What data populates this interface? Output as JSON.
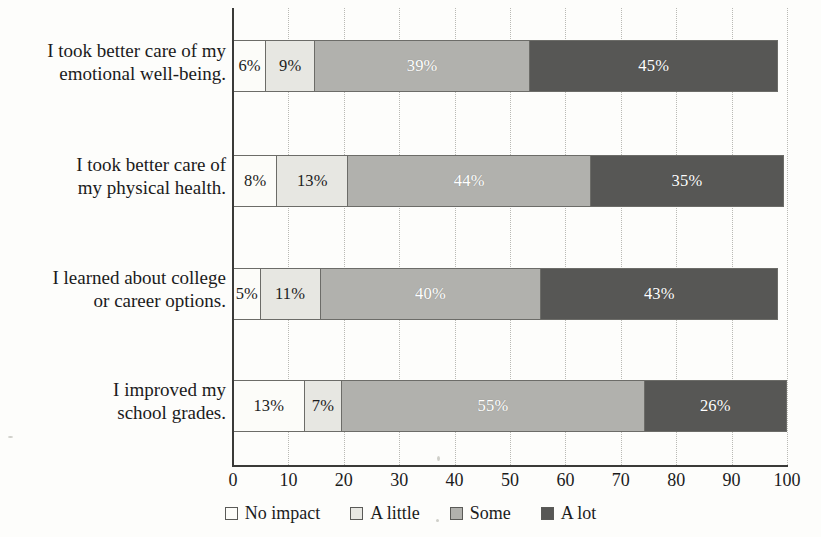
{
  "chart_data": {
    "type": "bar",
    "orientation": "horizontal",
    "stacked": true,
    "title": "",
    "xlabel": "",
    "ylabel": "",
    "xlim": [
      0,
      100
    ],
    "xticks": [
      "0",
      "10",
      "20",
      "30",
      "40",
      "50",
      "60",
      "70",
      "80",
      "90",
      "100"
    ],
    "grid": "vertical-dotted",
    "legend_position": "bottom-center",
    "categories": [
      "I took better care of my emotional well-being.",
      "I took better care of my physical health.",
      "I learned about college or career options.",
      "I improved my school grades."
    ],
    "series": [
      {
        "name": "No impact",
        "color": "#fcfcf9",
        "values": [
          6,
          8,
          5,
          13
        ]
      },
      {
        "name": "A little",
        "color": "#e7e7e2",
        "values": [
          9,
          13,
          11,
          7
        ]
      },
      {
        "name": "Some",
        "color": "#b1b1ad",
        "values": [
          39,
          44,
          40,
          55
        ]
      },
      {
        "name": "A lot",
        "color": "#575755",
        "values": [
          45,
          35,
          43,
          26
        ]
      }
    ],
    "data_labels": [
      [
        "6%",
        "9%",
        "39%",
        "45%"
      ],
      [
        "8%",
        "13%",
        "44%",
        "35%"
      ],
      [
        "5%",
        "11%",
        "40%",
        "43%"
      ],
      [
        "13%",
        "7%",
        "55%",
        "26%"
      ]
    ]
  },
  "axis": {
    "ticks": [
      {
        "label": "0",
        "value": 0
      },
      {
        "label": "10",
        "value": 10
      },
      {
        "label": "20",
        "value": 20
      },
      {
        "label": "30",
        "value": 30
      },
      {
        "label": "40",
        "value": 40
      },
      {
        "label": "50",
        "value": 50
      },
      {
        "label": "60",
        "value": 60
      },
      {
        "label": "70",
        "value": 70
      },
      {
        "label": "80",
        "value": 80
      },
      {
        "label": "90",
        "value": 90
      },
      {
        "label": "100",
        "value": 100
      }
    ]
  },
  "categories": [
    {
      "line1": "I took better care of my",
      "line2": "emotional well-being."
    },
    {
      "line1": "I took better care of",
      "line2": "my physical health."
    },
    {
      "line1": "I learned about college",
      "line2": "or career options."
    },
    {
      "line1": "I improved my",
      "line2": "school grades."
    }
  ],
  "legend": {
    "items": [
      {
        "label": "No impact",
        "color": "#fcfcf9"
      },
      {
        "label": "A little",
        "color": "#e7e7e2"
      },
      {
        "label": "Some",
        "color": "#b1b1ad"
      },
      {
        "label": "A lot",
        "color": "#575755"
      }
    ]
  }
}
